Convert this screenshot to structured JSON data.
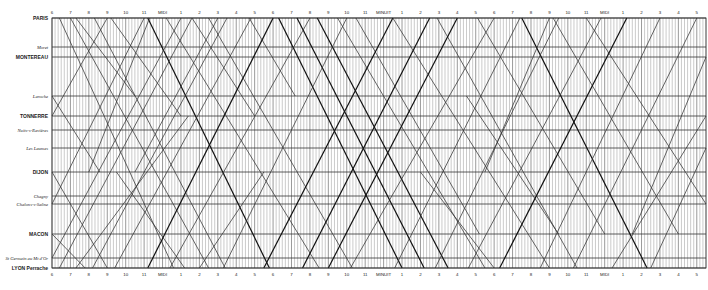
{
  "chart_data": {
    "type": "line",
    "xlabel": "Time of day",
    "ylabel": "Station (distance along line)",
    "grid": true,
    "x_range_hours": [
      6,
      41.5
    ],
    "grid_minutes_step": 10,
    "hour_labels": [
      "6",
      "7",
      "8",
      "9",
      "10",
      "11",
      "MIDI",
      "1",
      "2",
      "3",
      "4",
      "5",
      "6",
      "7",
      "8",
      "9",
      "10",
      "11",
      "MINUIT",
      "1",
      "2",
      "3",
      "4",
      "5",
      "6",
      "7",
      "8",
      "9",
      "10",
      "11",
      "MIDI",
      "1",
      "2",
      "3",
      "4",
      "5"
    ],
    "stations": [
      {
        "name": "PARIS",
        "y": 18,
        "style": "major"
      },
      {
        "name": "Moret",
        "y": 47,
        "style": "minor"
      },
      {
        "name": "MONTEREAU",
        "y": 57,
        "style": "major"
      },
      {
        "name": "Laroche",
        "y": 96,
        "style": "minor"
      },
      {
        "name": "TONNERRE",
        "y": 116,
        "style": "major"
      },
      {
        "name": "Nuits-s-Ravières",
        "y": 130,
        "style": "minor"
      },
      {
        "name": "Les Laumes",
        "y": 148,
        "style": "minor"
      },
      {
        "name": "DIJON",
        "y": 172,
        "style": "major"
      },
      {
        "name": "Chagny",
        "y": 196,
        "style": "minor"
      },
      {
        "name": "Chalons-s-Saône",
        "y": 204,
        "style": "minor"
      },
      {
        "name": "MACON",
        "y": 234,
        "style": "major"
      },
      {
        "name": "St Germain au Mt d'Or",
        "y": 258,
        "style": "minor"
      },
      {
        "name": "LYON Perrache",
        "y": 268,
        "style": "major"
      }
    ],
    "series": [
      {
        "name": "southbound",
        "trains": [
          [
            6.4,
            0,
            12.6,
            12,
            0
          ],
          [
            7.0,
            0,
            14.5,
            12,
            0
          ],
          [
            7.3,
            0,
            10.5,
            3,
            0
          ],
          [
            8.3,
            0,
            15.4,
            12,
            0
          ],
          [
            9.2,
            0,
            13.0,
            4,
            0
          ],
          [
            11.2,
            0,
            17.8,
            12,
            1
          ],
          [
            12.2,
            0,
            20.5,
            12,
            0
          ],
          [
            13.6,
            0,
            17.0,
            4,
            0
          ],
          [
            14.5,
            0,
            22.3,
            12,
            0
          ],
          [
            16.7,
            0,
            19.2,
            3,
            0
          ],
          [
            18.3,
            0,
            25.0,
            12,
            1
          ],
          [
            19.3,
            0,
            26.2,
            12,
            1
          ],
          [
            20.4,
            0,
            27.5,
            12,
            1
          ],
          [
            21.5,
            0,
            29.5,
            12,
            0
          ],
          [
            22.5,
            0,
            29.2,
            10,
            0
          ],
          [
            24.5,
            0,
            33.0,
            12,
            0
          ],
          [
            26.9,
            0,
            34.5,
            12,
            0
          ],
          [
            29.1,
            0,
            36.0,
            10,
            0
          ],
          [
            31.5,
            0,
            38.3,
            12,
            1
          ],
          [
            33.2,
            0,
            40.0,
            10,
            0
          ],
          [
            35.0,
            0,
            41.5,
            9,
            0
          ],
          [
            6.0,
            3,
            8.6,
            7,
            0
          ],
          [
            6.0,
            7,
            9.0,
            12,
            0
          ],
          [
            6.0,
            10,
            7.8,
            12,
            0
          ],
          [
            9.5,
            7,
            13.2,
            12,
            0
          ],
          [
            26.0,
            7,
            30.0,
            12,
            0
          ],
          [
            28.5,
            3,
            33.5,
            10,
            0
          ]
        ]
      },
      {
        "name": "northbound",
        "trains": [
          [
            6.0,
            9,
            11.0,
            0,
            0
          ],
          [
            6.0,
            11,
            13.0,
            0,
            0
          ],
          [
            6.4,
            12,
            13.6,
            0,
            0
          ],
          [
            7.3,
            12,
            13.4,
            4,
            0
          ],
          [
            8.2,
            12,
            15.5,
            0,
            0
          ],
          [
            9.4,
            12,
            16.8,
            0,
            0
          ],
          [
            11.2,
            12,
            18.0,
            0,
            1
          ],
          [
            12.4,
            12,
            20.0,
            0,
            0
          ],
          [
            14.0,
            12,
            17.5,
            7,
            0
          ],
          [
            15.3,
            12,
            22.0,
            0,
            0
          ],
          [
            17.5,
            12,
            24.5,
            0,
            1
          ],
          [
            19.6,
            12,
            26.5,
            0,
            1
          ],
          [
            21.0,
            12,
            28.0,
            0,
            1
          ],
          [
            22.2,
            12,
            30.0,
            0,
            0
          ],
          [
            24.6,
            12,
            31.4,
            0,
            0
          ],
          [
            26.8,
            12,
            33.5,
            0,
            0
          ],
          [
            28.6,
            12,
            35.8,
            0,
            0
          ],
          [
            30.3,
            12,
            37.2,
            0,
            1
          ],
          [
            32.5,
            12,
            39.0,
            0,
            0
          ],
          [
            34.3,
            12,
            41.0,
            0,
            0
          ],
          [
            36.4,
            12,
            41.5,
            4,
            0
          ],
          [
            6.0,
            4,
            9.0,
            0,
            0
          ],
          [
            8.0,
            7,
            11.3,
            0,
            0
          ],
          [
            10.5,
            7,
            15.0,
            0,
            0
          ],
          [
            29.5,
            7,
            33.0,
            0,
            0
          ],
          [
            37.5,
            10,
            41.5,
            2,
            0
          ],
          [
            38.5,
            12,
            41.5,
            6,
            0
          ]
        ]
      }
    ],
    "train_format": "[start_hour, start_station_index, end_hour, end_station_index, express_flag]"
  }
}
